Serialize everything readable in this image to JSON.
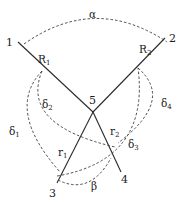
{
  "diagram": {
    "type": "geometric linkage diagram",
    "points": [
      {
        "id": "1",
        "label": "1",
        "x": 18,
        "y": 42
      },
      {
        "id": "2",
        "label": "2",
        "x": 165,
        "y": 38
      },
      {
        "id": "3",
        "label": "3",
        "x": 57,
        "y": 182
      },
      {
        "id": "4",
        "label": "4",
        "x": 120,
        "y": 170
      },
      {
        "id": "5",
        "label": "5",
        "x": 93,
        "y": 112
      }
    ],
    "segments": [
      {
        "from": "1",
        "to": "5",
        "label": "R",
        "subscript": "1"
      },
      {
        "from": "2",
        "to": "5",
        "label": "R",
        "subscript": "2"
      },
      {
        "from": "5",
        "to": "3",
        "label": "r",
        "subscript": "1"
      },
      {
        "from": "5",
        "to": "4",
        "label": "r",
        "subscript": "2"
      }
    ],
    "angles": [
      {
        "label": "α",
        "between": [
          "1",
          "2"
        ]
      },
      {
        "label": "β",
        "between": [
          "3",
          "4"
        ]
      }
    ],
    "arcs": [
      {
        "label": "δ",
        "subscript": "1"
      },
      {
        "label": "δ",
        "subscript": "2"
      },
      {
        "label": "δ",
        "subscript": "3"
      },
      {
        "label": "δ",
        "subscript": "4"
      }
    ]
  }
}
